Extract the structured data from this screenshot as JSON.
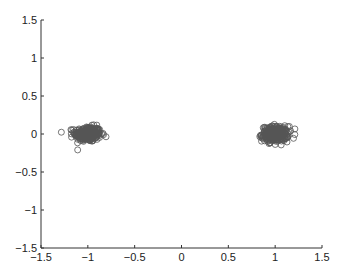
{
  "chart_data": {
    "type": "scatter",
    "title": "",
    "xlabel": "",
    "ylabel": "",
    "xlim": [
      -1.5,
      1.5
    ],
    "ylim": [
      -1.5,
      1.5
    ],
    "xticks": [
      -1.5,
      -1,
      -0.5,
      0,
      0.5,
      1,
      1.5
    ],
    "yticks": [
      -1.5,
      -1,
      -0.5,
      0,
      0.5,
      1,
      1.5
    ],
    "xtick_labels": [
      "−1.5",
      "−1",
      "−0.5",
      "0",
      "0.5",
      "1",
      "1.5"
    ],
    "ytick_labels": [
      "−1.5",
      "−1",
      "−0.5",
      "0",
      "0.5",
      "1",
      "1.5"
    ],
    "grid": false,
    "legend": null,
    "marker": "open-circle",
    "marker_color": "#555555",
    "series": [
      {
        "name": "cluster-left",
        "center": [
          -1.0,
          0.0
        ],
        "spread": [
          0.07,
          0.05
        ],
        "n": 300
      },
      {
        "name": "cluster-right",
        "center": [
          1.0,
          0.0
        ],
        "spread": [
          0.07,
          0.05
        ],
        "n": 300
      }
    ]
  }
}
